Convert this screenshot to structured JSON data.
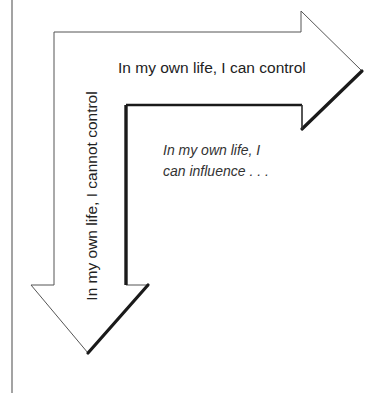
{
  "diagram": {
    "arrow_right_label": "In my own life, I can control",
    "arrow_down_label": "In my own life, I cannot control",
    "inner_label_line1": "In my own life, I",
    "inner_label_line2": "can influence . . ."
  },
  "colors": {
    "outline": "#444444",
    "shadow": "#1a1a1a",
    "fill": "#ffffff",
    "text": "#222222"
  }
}
